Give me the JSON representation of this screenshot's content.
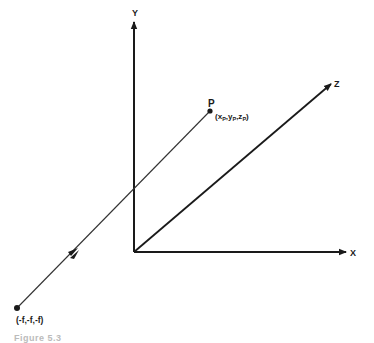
{
  "diagram": {
    "type": "3d-coordinate-axes-projection",
    "axes": {
      "x_label": "X",
      "y_label": "Y",
      "z_label": "Z"
    },
    "points": {
      "p_name": "P",
      "p_coords": "(xP,yP,zP)",
      "p_coords_main": "(x",
      "p_sub": "P",
      "center_label": "(-f,-f,-f)"
    },
    "caption": "Figure 5.3"
  }
}
